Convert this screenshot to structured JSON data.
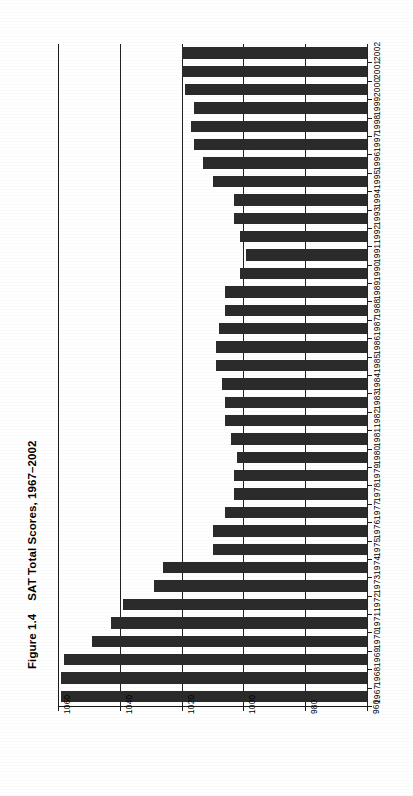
{
  "figure": {
    "number": "Figure 1.4",
    "title": "SAT Total Scores, 1967–2002"
  },
  "chart_data": {
    "type": "bar",
    "orientation": "horizontal-rotated",
    "title": "SAT Total Scores, 1967–2002",
    "xlabel": "",
    "ylabel": "",
    "value_axis": {
      "ticks": [
        "1060",
        "1040",
        "1020",
        "1000",
        "980",
        "960"
      ],
      "min": 960,
      "max": 1060,
      "reversed": true,
      "baseline": 960
    },
    "grid": true,
    "legend": "none",
    "bar_color": "#2b2b2b",
    "categories": [
      "2002",
      "2001",
      "2000",
      "1999",
      "1998",
      "1997",
      "1996",
      "1995",
      "1994",
      "1993",
      "1992",
      "1991",
      "1990",
      "1989",
      "1988",
      "1987",
      "1986",
      "1985",
      "1984",
      "1983",
      "1982",
      "1981",
      "1980",
      "1979",
      "1978",
      "1977",
      "1976",
      "1975",
      "1974",
      "1973",
      "1972",
      "1971",
      "1970",
      "1969",
      "1968",
      "1967"
    ],
    "values": [
      1020,
      1020,
      1019,
      1016,
      1017,
      1016,
      1013,
      1010,
      1003,
      1003,
      1001,
      999,
      1001,
      1006,
      1006,
      1008,
      1009,
      1009,
      1007,
      1006,
      1006,
      1004,
      1002,
      1003,
      1003,
      1006,
      1010,
      1010,
      1026,
      1029,
      1039,
      1043,
      1049,
      1058,
      1059,
      1059
    ],
    "series": [
      {
        "name": "SAT Total Score",
        "values": [
          1020,
          1020,
          1019,
          1016,
          1017,
          1016,
          1013,
          1010,
          1003,
          1003,
          1001,
          999,
          1001,
          1006,
          1006,
          1008,
          1009,
          1009,
          1007,
          1006,
          1006,
          1004,
          1002,
          1003,
          1003,
          1006,
          1010,
          1010,
          1026,
          1029,
          1039,
          1043,
          1049,
          1058,
          1059,
          1059
        ]
      }
    ]
  }
}
